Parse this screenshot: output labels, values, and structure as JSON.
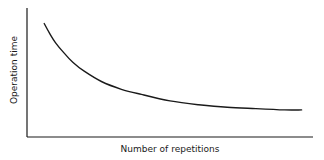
{
  "chart_data": {
    "type": "line",
    "title": "",
    "xlabel": "Number of repetitions",
    "ylabel": "Operation time",
    "grid": false,
    "ticks": false,
    "xlim": [
      0,
      100
    ],
    "ylim": [
      0,
      100
    ],
    "series": [
      {
        "name": "learning-curve",
        "x": [
          6,
          8,
          10,
          13,
          16,
          20,
          26,
          33,
          40,
          50,
          60,
          70,
          80,
          90,
          96
        ],
        "y": [
          88,
          80,
          73,
          65,
          58,
          51,
          43,
          37,
          33,
          28,
          25,
          23,
          22,
          21,
          21
        ]
      }
    ]
  },
  "colors": {
    "line": "#1a1a1a",
    "axis": "#1a1a1a",
    "background": "#ffffff"
  }
}
